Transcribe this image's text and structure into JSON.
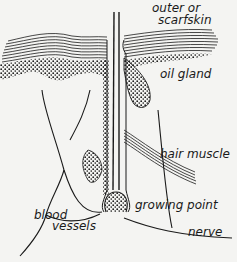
{
  "diagram": {
    "labels": {
      "outer_line1": "outer or",
      "outer_line2": "scarfskin",
      "oil_gland": "oil gland",
      "hair_muscle": "hair muscle",
      "growing_point": "growing point",
      "blood_line1": "blood",
      "blood_line2": "vessels",
      "nerve": "nerve"
    },
    "colors": {
      "ink": "#1a1a1a",
      "paper": "#f4f4f2"
    }
  }
}
